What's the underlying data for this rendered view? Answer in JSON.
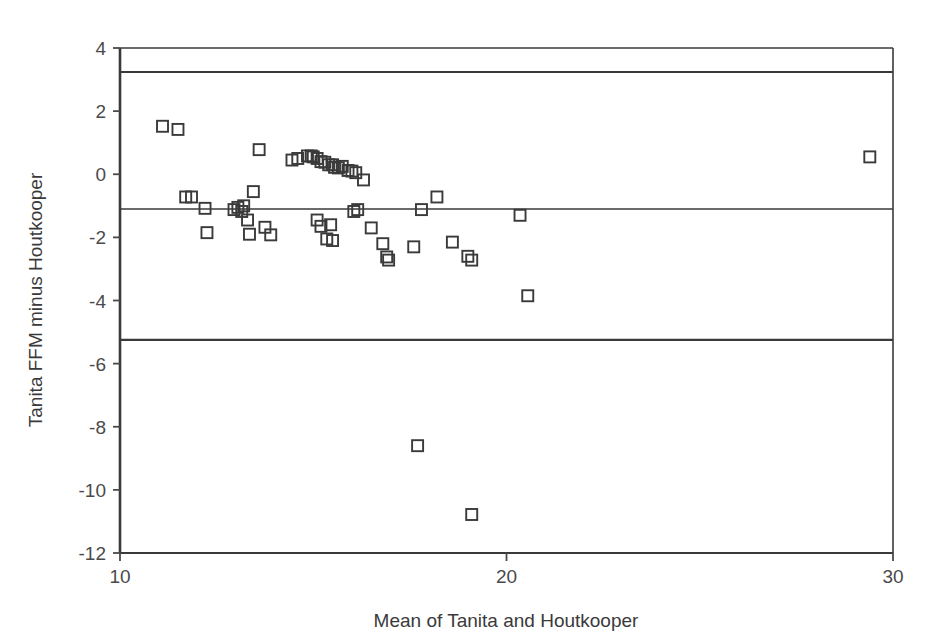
{
  "chart_data": {
    "type": "scatter",
    "title": "",
    "subtitle": "",
    "xlabel": "Mean of Tanita and Houtkooper",
    "ylabel": "Tanita FFM minus Houtkooper",
    "xlim": [
      10,
      30
    ],
    "ylim": [
      -12,
      4
    ],
    "xticks": [
      10,
      20,
      30
    ],
    "xtick_labels": [
      "10",
      "20",
      "30"
    ],
    "yticks": [
      4,
      2,
      0,
      -2,
      -4,
      -6,
      -8,
      -10,
      -12
    ],
    "ytick_labels": [
      "4",
      "2",
      "0",
      "-2",
      "-4",
      "-6",
      "-8",
      "-10",
      "-12"
    ],
    "grid": false,
    "legend": null,
    "marker": "open-square",
    "marker_color": "#3a3a3a",
    "reference_lines": [
      {
        "name": "upper-limit-of-agreement",
        "y": 3.24,
        "label": ""
      },
      {
        "name": "mean-bias",
        "y": -1.1,
        "label": ""
      },
      {
        "name": "lower-limit-of-agreement",
        "y": -5.25,
        "label": ""
      }
    ],
    "points": [
      {
        "x": 11.1,
        "y": 1.52
      },
      {
        "x": 11.5,
        "y": 1.42
      },
      {
        "x": 11.7,
        "y": -0.72
      },
      {
        "x": 11.85,
        "y": -0.72
      },
      {
        "x": 12.2,
        "y": -1.08
      },
      {
        "x": 12.25,
        "y": -1.85
      },
      {
        "x": 12.95,
        "y": -1.12
      },
      {
        "x": 13.05,
        "y": -1.05
      },
      {
        "x": 13.15,
        "y": -1.18
      },
      {
        "x": 13.2,
        "y": -1.0
      },
      {
        "x": 13.3,
        "y": -1.45
      },
      {
        "x": 13.35,
        "y": -1.9
      },
      {
        "x": 13.45,
        "y": -0.55
      },
      {
        "x": 13.6,
        "y": 0.78
      },
      {
        "x": 13.75,
        "y": -1.68
      },
      {
        "x": 13.9,
        "y": -1.92
      },
      {
        "x": 14.45,
        "y": 0.45
      },
      {
        "x": 14.6,
        "y": 0.5
      },
      {
        "x": 14.85,
        "y": 0.58
      },
      {
        "x": 14.95,
        "y": 0.58
      },
      {
        "x": 15.0,
        "y": 0.55
      },
      {
        "x": 15.1,
        "y": 0.5
      },
      {
        "x": 15.2,
        "y": 0.4
      },
      {
        "x": 15.3,
        "y": 0.38
      },
      {
        "x": 15.4,
        "y": 0.3
      },
      {
        "x": 15.5,
        "y": 0.3
      },
      {
        "x": 15.55,
        "y": 0.22
      },
      {
        "x": 15.65,
        "y": 0.2
      },
      {
        "x": 15.75,
        "y": 0.25
      },
      {
        "x": 15.9,
        "y": 0.12
      },
      {
        "x": 16.0,
        "y": 0.1
      },
      {
        "x": 16.1,
        "y": 0.05
      },
      {
        "x": 16.3,
        "y": -0.18
      },
      {
        "x": 15.1,
        "y": -1.45
      },
      {
        "x": 15.2,
        "y": -1.65
      },
      {
        "x": 15.35,
        "y": -2.05
      },
      {
        "x": 15.45,
        "y": -1.6
      },
      {
        "x": 15.5,
        "y": -2.1
      },
      {
        "x": 16.05,
        "y": -1.18
      },
      {
        "x": 16.15,
        "y": -1.12
      },
      {
        "x": 16.5,
        "y": -1.7
      },
      {
        "x": 16.8,
        "y": -2.2
      },
      {
        "x": 16.9,
        "y": -2.62
      },
      {
        "x": 16.95,
        "y": -2.72
      },
      {
        "x": 17.6,
        "y": -2.3
      },
      {
        "x": 17.8,
        "y": -1.12
      },
      {
        "x": 18.2,
        "y": -0.72
      },
      {
        "x": 18.6,
        "y": -2.15
      },
      {
        "x": 19.0,
        "y": -2.6
      },
      {
        "x": 19.1,
        "y": -2.72
      },
      {
        "x": 20.35,
        "y": -1.3
      },
      {
        "x": 20.55,
        "y": -3.85
      },
      {
        "x": 17.7,
        "y": -8.6
      },
      {
        "x": 19.1,
        "y": -10.78
      },
      {
        "x": 29.4,
        "y": 0.55
      }
    ]
  },
  "axis": {
    "x_title": "Mean of Tanita and Houtkooper",
    "y_title": "Tanita FFM minus Houtkooper"
  }
}
